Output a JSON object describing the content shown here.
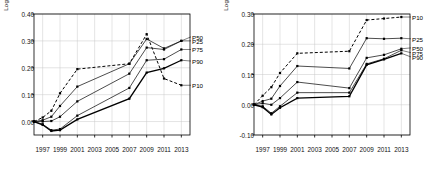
{
  "chart_data": [
    {
      "type": "line",
      "panel": "left",
      "title": "",
      "xlabel": "",
      "ylabel": "Log (normalized to 0 in 1996)",
      "xlim": [
        1996,
        2014
      ],
      "ylim": [
        -0.05,
        0.4
      ],
      "yticks": [
        0.0,
        0.1,
        0.2,
        0.3,
        0.4
      ],
      "ytick_labels": [
        "0.00",
        "0.10",
        "0.20",
        "0.30",
        "0.40"
      ],
      "xticks": [
        1997,
        1999,
        2001,
        2003,
        2005,
        2007,
        2009,
        2011,
        2013
      ],
      "xtick_labels": [
        "1997",
        "1999",
        "2001",
        "2003",
        "2005",
        "2007",
        "2009",
        "2011",
        "2013"
      ],
      "grid": true,
      "legend_position": "right-inline",
      "x": [
        1996,
        1997,
        1998,
        1999,
        2001,
        2007,
        2009,
        2011,
        2013
      ],
      "series": [
        {
          "name": "P10",
          "style": "dashed",
          "label_y": 0.135,
          "values": [
            0.0,
            0.015,
            0.04,
            0.105,
            0.195,
            0.215,
            0.325,
            0.16,
            0.135
          ]
        },
        {
          "name": "P25",
          "style": "solid",
          "label_y": 0.3,
          "values": [
            0.0,
            0.005,
            0.018,
            0.058,
            0.13,
            0.215,
            0.307,
            0.272,
            0.3
          ]
        },
        {
          "name": "P50",
          "style": "solid",
          "label_y": 0.315,
          "values": [
            0.0,
            0.0,
            0.002,
            0.018,
            0.075,
            0.178,
            0.275,
            0.268,
            0.3
          ]
        },
        {
          "name": "P75",
          "style": "solid",
          "label_y": 0.268,
          "values": [
            0.0,
            -0.01,
            -0.032,
            -0.028,
            0.022,
            0.125,
            0.228,
            0.232,
            0.268
          ]
        },
        {
          "name": "P90",
          "style": "solid-bold",
          "label_y": 0.225,
          "values": [
            0.0,
            -0.012,
            -0.035,
            -0.032,
            0.008,
            0.085,
            0.182,
            0.198,
            0.228
          ]
        }
      ]
    },
    {
      "type": "line",
      "panel": "right",
      "title": "",
      "xlabel": "",
      "ylabel": "Log (normalized to 0 in 1996)",
      "xlim": [
        1996,
        2014
      ],
      "ylim": [
        -0.1,
        0.3
      ],
      "yticks": [
        -0.1,
        0.0,
        0.1,
        0.2,
        0.3
      ],
      "ytick_labels": [
        "-0.10",
        "0.00",
        "0.10",
        "0.20",
        "0.30"
      ],
      "xticks": [
        1997,
        1999,
        2001,
        2003,
        2005,
        2007,
        2009,
        2011,
        2013
      ],
      "xtick_labels": [
        "1997",
        "1999",
        "2001",
        "2003",
        "2005",
        "2007",
        "2009",
        "2011",
        "2013"
      ],
      "grid": true,
      "legend_position": "right-inline",
      "x": [
        1996,
        1997,
        1998,
        1999,
        2001,
        2007,
        2009,
        2011,
        2013
      ],
      "series": [
        {
          "name": "P10",
          "style": "dashed",
          "label_y": 0.29,
          "values": [
            0.0,
            0.03,
            0.058,
            0.105,
            0.17,
            0.177,
            0.28,
            0.285,
            0.29
          ]
        },
        {
          "name": "P25",
          "style": "solid",
          "label_y": 0.218,
          "values": [
            0.0,
            0.012,
            0.02,
            0.062,
            0.128,
            0.12,
            0.22,
            0.218,
            0.22
          ]
        },
        {
          "name": "P50",
          "style": "solid",
          "label_y": 0.188,
          "values": [
            0.0,
            0.005,
            0.0,
            0.022,
            0.075,
            0.055,
            0.155,
            0.165,
            0.185
          ]
        },
        {
          "name": "P75",
          "style": "solid",
          "label_y": 0.172,
          "values": [
            0.0,
            -0.005,
            -0.028,
            -0.005,
            0.04,
            0.04,
            0.135,
            0.152,
            0.18
          ]
        },
        {
          "name": "P90",
          "style": "solid-bold",
          "label_y": 0.158,
          "values": [
            0.0,
            -0.008,
            -0.032,
            -0.01,
            0.022,
            0.028,
            0.132,
            0.15,
            0.17
          ]
        }
      ]
    }
  ]
}
